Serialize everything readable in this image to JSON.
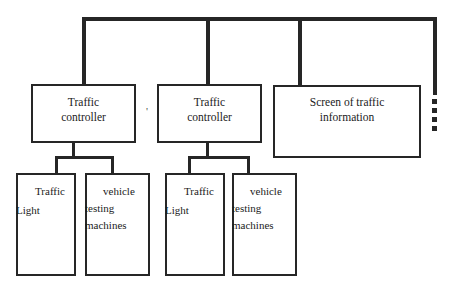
{
  "diagram": {
    "colors": {
      "stroke": "#262626",
      "text": "#1b1b1b",
      "background": "#ffffff"
    },
    "bus": {
      "name": "communication-bus",
      "continuation_marker": "vertical-ellipsis-dots",
      "dot_count": 4
    },
    "nodes": {
      "controller_1": "Traffic\ncontroller",
      "controller_2": "Traffic\ncontroller",
      "screen": "Screen of traffic\ninformation",
      "traffic_light_1": {
        "line1": "Traffic",
        "line2": "Light"
      },
      "vehicle_machines_1": {
        "line1": "vehicle",
        "line2": "testing",
        "line3": "machines"
      },
      "traffic_light_2": {
        "line1": "Traffic",
        "line2": "Light"
      },
      "vehicle_machines_2": {
        "line1": "vehicle",
        "line2": "testing",
        "line3": "machines"
      }
    },
    "marks": {
      "stray_apostrophe": "'"
    }
  }
}
